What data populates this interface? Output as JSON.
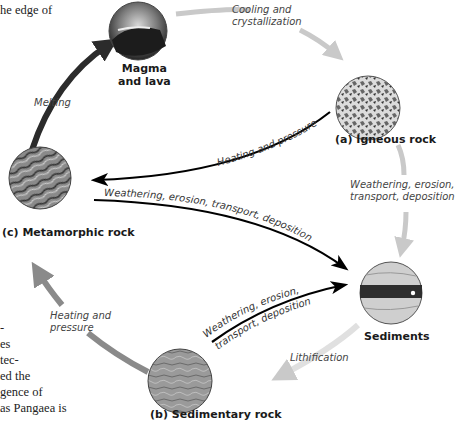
{
  "book_text": {
    "top_fragment": "he edge of",
    "left_lines": [
      "-",
      "es",
      "tec-",
      "ed the",
      "gence of",
      "as Pangaea is"
    ]
  },
  "nodes": {
    "magma": {
      "label_line1": "Magma",
      "label_line2": "and lava"
    },
    "igneous": {
      "label": "(a) Igneous rock"
    },
    "metamorphic": {
      "label": "(c) Metamorphic rock"
    },
    "sediments": {
      "label": "Sediments"
    },
    "sedimentary": {
      "label": "(b) Sedimentary rock"
    }
  },
  "processes": {
    "cooling": {
      "line1": "Cooling and",
      "line2": "crystallization"
    },
    "melting": "Melting",
    "weathering_igneous": {
      "line1": "Weathering, erosion,",
      "line2": "transport, deposition"
    },
    "lithification": "Lithification",
    "heating_sed": {
      "line1": "Heating and",
      "line2": "pressure"
    },
    "heating_ign_to_meta": "Heating and pressure",
    "weathering_meta": "Weathering, erosion, transport, deposition",
    "weathering_sed": {
      "line1": "Weathering, erosion,",
      "line2": "transport, deposition"
    }
  },
  "colors": {
    "dark_arrow": "#2b2b2b",
    "mid_arrow": "#8a8a8a",
    "light_arrow": "#c9c9c9",
    "black_line": "#000000"
  }
}
